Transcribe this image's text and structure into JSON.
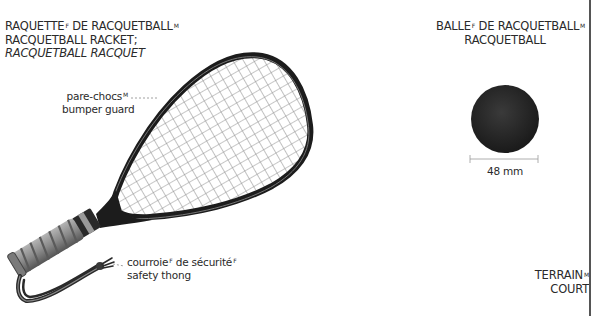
{
  "racket": {
    "title_fr": "RAQUETTE",
    "title_fr_gender": "F",
    "title_fr_rest": " DE RACQUETBALL",
    "title_fr_rest_gender": "M",
    "title_en": "RACQUETBALL RACKET;",
    "title_en_alt": "RACQUETBALL RACQUET",
    "parts": [
      {
        "fr": "pare-chocs",
        "fr_gender": "M",
        "en": "bumper guard"
      },
      {
        "fr": "courroie",
        "fr_gender": "F",
        "fr_rest": " de sécurité",
        "fr_rest_gender": "F",
        "en": "safety thong"
      }
    ]
  },
  "ball": {
    "title_fr": "BALLE",
    "title_fr_gender": "F",
    "title_fr_rest": " DE RACQUETBALL",
    "title_fr_rest_gender": "M",
    "title_en": "RACQUETBALL",
    "diameter": "48 mm"
  },
  "court": {
    "title_fr": "TERRAIN",
    "title_fr_gender": "M",
    "title_en": "COURT"
  },
  "colors": {
    "frame": "#1c1c1c",
    "strings": "#9a9a9a",
    "grip": "#8c8c8c",
    "ball": "#262626",
    "text": "#2a2a2a"
  }
}
